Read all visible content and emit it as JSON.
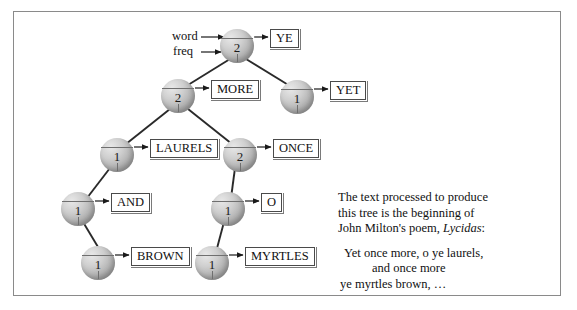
{
  "figure": {
    "type": "binary-search-tree-diagram",
    "annotations": {
      "word_label": "word",
      "freq_label": "freq"
    },
    "nodes": [
      {
        "id": "ye",
        "freq": "2",
        "word": "YE",
        "x": 237,
        "y": 46
      },
      {
        "id": "more",
        "freq": "2",
        "word": "MORE",
        "x": 178,
        "y": 96
      },
      {
        "id": "yet",
        "freq": "1",
        "word": "YET",
        "x": 297,
        "y": 97
      },
      {
        "id": "laurels",
        "freq": "1",
        "word": "LAURELS",
        "x": 117,
        "y": 155
      },
      {
        "id": "once",
        "freq": "2",
        "word": "ONCE",
        "x": 240,
        "y": 155
      },
      {
        "id": "and",
        "freq": "1",
        "word": "AND",
        "x": 78,
        "y": 209
      },
      {
        "id": "o",
        "freq": "1",
        "word": "O",
        "x": 228,
        "y": 209
      },
      {
        "id": "brown",
        "freq": "1",
        "word": "BROWN",
        "x": 98,
        "y": 263
      },
      {
        "id": "myrtles",
        "freq": "1",
        "word": "MYRTLES",
        "x": 212,
        "y": 263
      }
    ],
    "edges": [
      {
        "from": "ye",
        "to": "more"
      },
      {
        "from": "ye",
        "to": "yet"
      },
      {
        "from": "more",
        "to": "laurels"
      },
      {
        "from": "more",
        "to": "once"
      },
      {
        "from": "laurels",
        "to": "and"
      },
      {
        "from": "once",
        "to": "o"
      },
      {
        "from": "and",
        "to": "brown"
      },
      {
        "from": "o",
        "to": "myrtles"
      }
    ]
  },
  "caption": {
    "line1": "The text processed to produce",
    "line2": "this tree is the beginning of",
    "line3_a": "John Milton's poem, ",
    "line3_italic": "Lycidas",
    "line3_b": ":",
    "poem_line1": "Yet once more, o ye laurels,",
    "poem_line2": "and once more",
    "poem_line3": "ye myrtles brown, …"
  }
}
